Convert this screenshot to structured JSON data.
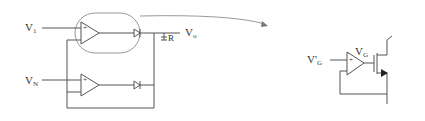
{
  "left_circuit": {
    "input_top": "V",
    "input_top_sub": "1",
    "input_bottom": "V",
    "input_bottom_sub": "N",
    "output": "V",
    "output_sub": "o",
    "resistor": "R",
    "opamp_plus": "+",
    "opamp_minus": "-"
  },
  "right_circuit": {
    "input": "V'",
    "input_sub": "G",
    "gate": "V",
    "gate_sub": "G",
    "opamp_plus": "+",
    "opamp_minus": "-"
  },
  "colors": {
    "line": "#555555",
    "arrow": "#777777",
    "highlight": "#888888"
  }
}
